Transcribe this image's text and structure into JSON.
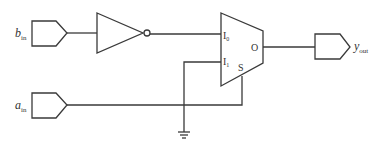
{
  "diagram": {
    "type": "logic-circuit",
    "inputs": [
      {
        "id": "b_in",
        "label_main": "b",
        "label_sub": "in"
      },
      {
        "id": "a_in",
        "label_main": "a",
        "label_sub": "in"
      }
    ],
    "outputs": [
      {
        "id": "y_out",
        "label_main": "y",
        "label_sub": "out"
      }
    ],
    "components": {
      "inverter": {
        "name": "NOT gate"
      },
      "mux": {
        "name": "2:1 multiplexer",
        "pin_i0_main": "I",
        "pin_i0_sub": "0",
        "pin_i1_main": "I",
        "pin_i1_sub": "1",
        "pin_s": "S",
        "pin_o": "O"
      },
      "ground": {
        "name": "ground"
      }
    },
    "connections": [
      "b_in -> inverter -> mux.I0",
      "ground -> mux.I1",
      "a_in -> mux.S",
      "mux.O -> y_out"
    ]
  }
}
